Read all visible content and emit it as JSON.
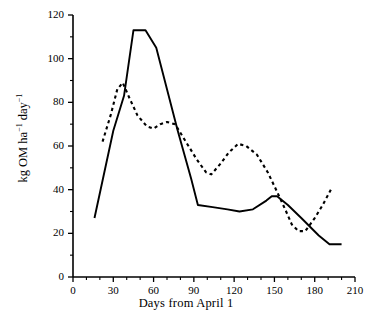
{
  "figure": {
    "background_color": "#ffffff",
    "line_color": "#000000"
  },
  "axes": {
    "x_title": "Days from April 1",
    "y_title_parts": {
      "main1": "kg OM ha",
      "sup1": "−1",
      "main2": " day",
      "sup2": "−1"
    },
    "x_ticks": [
      "0",
      "30",
      "60",
      "90",
      "120",
      "150",
      "180",
      "210"
    ],
    "y_ticks": [
      "0",
      "20",
      "40",
      "60",
      "80",
      "100",
      "120"
    ],
    "x_minor_interval": 10,
    "y_minor_interval": 10
  },
  "chart_data": {
    "type": "line",
    "title": "",
    "xlabel": "Days from April 1",
    "ylabel": "kg OM ha-1 day-1",
    "xlim": [
      0,
      210
    ],
    "ylim": [
      0,
      120
    ],
    "grid": false,
    "legend": "none",
    "x_ticks": [
      0,
      30,
      60,
      90,
      120,
      150,
      180,
      210
    ],
    "y_ticks": [
      0,
      20,
      40,
      60,
      80,
      100,
      120
    ],
    "series": [
      {
        "name": "solid-series",
        "style": "solid",
        "color": "#000000",
        "points": [
          [
            16,
            27
          ],
          [
            30,
            67
          ],
          [
            38,
            83
          ],
          [
            45,
            113
          ],
          [
            54,
            113
          ],
          [
            62,
            105
          ],
          [
            78,
            67
          ],
          [
            88,
            45
          ],
          [
            93,
            33
          ],
          [
            104,
            32
          ],
          [
            115,
            31
          ],
          [
            124,
            30
          ],
          [
            134,
            31
          ],
          [
            144,
            35
          ],
          [
            148,
            37
          ],
          [
            152,
            37
          ],
          [
            160,
            33
          ],
          [
            170,
            27
          ],
          [
            183,
            19
          ],
          [
            191,
            15
          ],
          [
            200,
            15
          ]
        ]
      },
      {
        "name": "dashed-series",
        "style": "dashed",
        "color": "#000000",
        "points": [
          [
            22,
            62
          ],
          [
            28,
            74
          ],
          [
            33,
            86
          ],
          [
            37,
            89
          ],
          [
            42,
            82
          ],
          [
            48,
            74
          ],
          [
            55,
            69
          ],
          [
            60,
            68
          ],
          [
            65,
            70
          ],
          [
            70,
            71
          ],
          [
            76,
            70
          ],
          [
            84,
            62
          ],
          [
            92,
            54
          ],
          [
            99,
            48
          ],
          [
            103,
            47
          ],
          [
            110,
            52
          ],
          [
            116,
            57
          ],
          [
            123,
            61
          ],
          [
            129,
            60
          ],
          [
            137,
            56
          ],
          [
            145,
            48
          ],
          [
            152,
            39
          ],
          [
            158,
            31
          ],
          [
            163,
            24
          ],
          [
            168,
            21
          ],
          [
            173,
            21
          ],
          [
            180,
            27
          ],
          [
            186,
            33
          ],
          [
            192,
            40
          ]
        ]
      }
    ]
  }
}
